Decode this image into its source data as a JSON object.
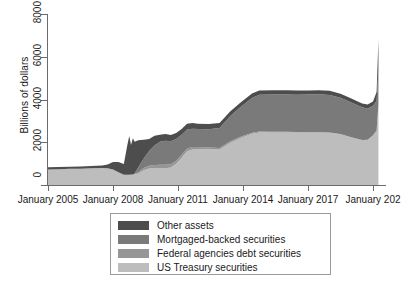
{
  "chart": {
    "type": "area",
    "title": "",
    "ylabel": "Billions of dollars",
    "xlabel": ""
  },
  "yaxis": {
    "ticks": [
      "0",
      "2000",
      "4000",
      "6000",
      "8000"
    ],
    "min": 0,
    "max": 8000
  },
  "xaxis": {
    "ticks": [
      "January 2005",
      "January 2008",
      "January 2011",
      "January 2014",
      "January 2017",
      "January 202"
    ]
  },
  "legend": {
    "items": [
      {
        "label": "Other assets",
        "color": "#4d4d4d"
      },
      {
        "label": "Mortgaged-backed securities",
        "color": "#7a7a7a"
      },
      {
        "label": "Federal agencies debt securities",
        "color": "#969696"
      },
      {
        "label": "US Treasury securities",
        "color": "#bdbdbd"
      }
    ]
  },
  "chart_data": {
    "type": "area",
    "stacked": true,
    "title": "",
    "xlabel": "",
    "ylabel": "Billions of dollars",
    "ylim": [
      0,
      8000
    ],
    "yticks": [
      0,
      2000,
      4000,
      6000,
      8000
    ],
    "xticks": [
      "January 2005",
      "January 2008",
      "January 2011",
      "January 2014",
      "January 2017",
      "January 202"
    ],
    "grid": false,
    "legend_position": "below-plot",
    "x": [
      "2004-01",
      "2004-07",
      "2005-01",
      "2005-07",
      "2006-01",
      "2006-07",
      "2007-01",
      "2007-07",
      "2007-10",
      "2008-01",
      "2008-04",
      "2008-07",
      "2008-09",
      "2008-10",
      "2008-11",
      "2008-12",
      "2009-01",
      "2009-03",
      "2009-06",
      "2009-09",
      "2009-12",
      "2010-03",
      "2010-06",
      "2010-09",
      "2010-12",
      "2011-03",
      "2011-06",
      "2011-09",
      "2011-12",
      "2012-06",
      "2012-12",
      "2013-06",
      "2013-12",
      "2014-06",
      "2014-10",
      "2015-06",
      "2016-01",
      "2016-07",
      "2017-01",
      "2017-07",
      "2018-01",
      "2018-07",
      "2019-01",
      "2019-07",
      "2019-10",
      "2020-01",
      "2020-03",
      "2020-04"
    ],
    "series": [
      {
        "name": "US Treasury securities",
        "color": "#bdbdbd",
        "values": [
          700,
          715,
          730,
          740,
          755,
          765,
          780,
          790,
          780,
          720,
          600,
          480,
          480,
          476,
          476,
          476,
          505,
          540,
          690,
          770,
          780,
          780,
          780,
          815,
          990,
          1280,
          1580,
          1665,
          1670,
          1670,
          1660,
          1980,
          2210,
          2400,
          2460,
          2460,
          2460,
          2460,
          2460,
          2465,
          2450,
          2380,
          2230,
          2100,
          2120,
          2320,
          2550,
          3780
        ]
      },
      {
        "name": "Federal agencies debt securities",
        "color": "#969696",
        "values": [
          0,
          0,
          0,
          0,
          0,
          0,
          0,
          0,
          0,
          0,
          0,
          0,
          0,
          0,
          10,
          20,
          25,
          55,
          100,
          130,
          160,
          169,
          165,
          155,
          147,
          130,
          120,
          110,
          105,
          90,
          75,
          65,
          57,
          45,
          41,
          33,
          28,
          24,
          13,
          8,
          5,
          3,
          2,
          2,
          2,
          2,
          2,
          2
        ]
      },
      {
        "name": "Mortgaged-backed securities",
        "color": "#7a7a7a",
        "values": [
          0,
          0,
          0,
          0,
          0,
          0,
          0,
          0,
          0,
          0,
          0,
          0,
          0,
          0,
          0,
          0,
          10,
          240,
          450,
          690,
          910,
          1070,
          1120,
          1080,
          1010,
          940,
          900,
          860,
          840,
          850,
          930,
          1180,
          1400,
          1630,
          1720,
          1740,
          1750,
          1740,
          1760,
          1770,
          1760,
          1700,
          1630,
          1530,
          1450,
          1380,
          1380,
          1580
        ]
      },
      {
        "name": "Other assets",
        "color": "#4d4d4d",
        "values": [
          100,
          100,
          100,
          100,
          100,
          100,
          110,
          120,
          180,
          360,
          480,
          500,
          1420,
          1820,
          1380,
          1690,
          1480,
          1260,
          880,
          560,
          450,
          330,
          320,
          290,
          280,
          270,
          260,
          260,
          255,
          240,
          230,
          220,
          215,
          205,
          205,
          200,
          200,
          200,
          190,
          190,
          190,
          185,
          185,
          185,
          190,
          200,
          420,
          1430
        ]
      }
    ],
    "annotations": [
      {
        "text": "2008 financial crisis liquidity spike",
        "x": "2008-10",
        "y": 2300
      },
      {
        "text": "COVID-19 emergency expansion",
        "x": "2020-04",
        "y": 6790
      }
    ]
  }
}
